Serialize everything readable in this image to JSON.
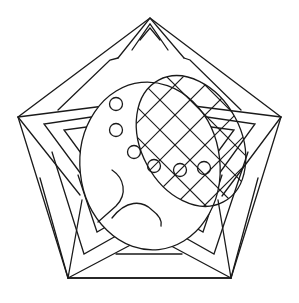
{
  "drawing": {
    "stroke_color": "#1a1a1a",
    "background_color": "#ffffff",
    "shapes": [
      "outer-pentagon",
      "star-chevrons",
      "large-oval",
      "crosshatched-oval",
      "small-circles",
      "hook-curves"
    ],
    "small_circle_count": 7
  }
}
